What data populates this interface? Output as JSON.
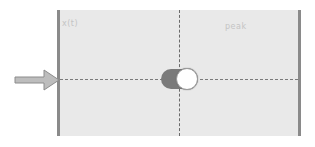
{
  "diagram": {
    "labels": {
      "left": "x(t)",
      "right": "peak"
    },
    "toggle": {
      "state": "on",
      "track_color": "#7a7a7a",
      "knob_color": "#ffffff"
    },
    "panel_color": "#e9e9e9",
    "arrow_icon": "right-arrow-icon"
  }
}
